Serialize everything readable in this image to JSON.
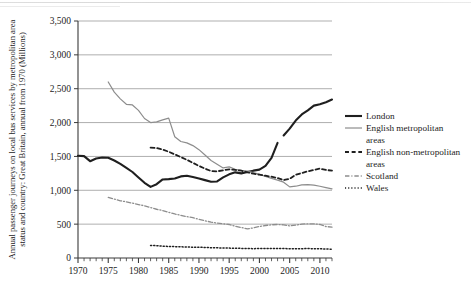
{
  "chart_data": {
    "type": "line",
    "title": "",
    "xlabel": "",
    "ylabel": "Annual passenger journeys on local bus services by metropolitan area status and country: Great Britain, annual from 1970 (Millions)",
    "ylabel_line1": "Annual passenger journeys on local bus services by metropolitan area",
    "ylabel_line2": "status and country: Great Britain, annual from 1970 (Millions)",
    "xlim": [
      1970,
      2012
    ],
    "ylim": [
      0,
      3500
    ],
    "y_ticks": [
      0,
      500,
      1000,
      1500,
      2000,
      2500,
      3000,
      3500
    ],
    "y_tick_labels": [
      "0",
      "500",
      "1,000",
      "1,500",
      "2,000",
      "2,500",
      "3,000",
      "3,500"
    ],
    "x_ticks": [
      1970,
      1975,
      1980,
      1985,
      1990,
      1995,
      2000,
      2005,
      2010
    ],
    "x_tick_labels": [
      "1970",
      "1975",
      "1980",
      "1985",
      "1990",
      "1995",
      "2000",
      "2005",
      "2010"
    ],
    "x_minor_step": 1,
    "grid": "horizontal",
    "legend_position": "right",
    "series": [
      {
        "name": "London",
        "style": "solid",
        "color": "#1f1f1f",
        "width": 2.1,
        "segments": [
          {
            "x": [
              1970,
              1971,
              1972,
              1973,
              1974,
              1975,
              1976,
              1977,
              1978,
              1979,
              1980,
              1981,
              1982,
              1983,
              1984,
              1985,
              1986,
              1987,
              1988,
              1989,
              1990,
              1991,
              1992,
              1993,
              1994,
              1995,
              1996,
              1997,
              1998,
              1999,
              2000,
              2001,
              2002,
              2003
            ],
            "y": [
              1510,
              1505,
              1430,
              1470,
              1485,
              1480,
              1440,
              1390,
              1330,
              1270,
              1190,
              1110,
              1050,
              1090,
              1160,
              1165,
              1175,
              1205,
              1215,
              1195,
              1175,
              1150,
              1125,
              1130,
              1190,
              1235,
              1265,
              1250,
              1270,
              1290,
              1305,
              1360,
              1480,
              1700
            ]
          },
          {
            "x": [
              2004,
              2005,
              2006,
              2007,
              2008,
              2009,
              2010,
              2011,
              2012
            ],
            "y": [
              1810,
              1910,
              2030,
              2120,
              2180,
              2250,
              2270,
              2300,
              2340
            ]
          }
        ]
      },
      {
        "name": "English metropolitan areas",
        "style": "solid",
        "color": "#8d8d8d",
        "width": 1.2,
        "segments": [
          {
            "x": [
              1975,
              1976,
              1977,
              1978,
              1979,
              1980,
              1981,
              1982,
              1983,
              1984,
              1985,
              1986,
              1987,
              1988,
              1989,
              1990,
              1991,
              1992,
              1993,
              1994,
              1995,
              1996,
              1997,
              1998,
              1999,
              2000,
              2001,
              2002,
              2003,
              2004,
              2005,
              2006,
              2007,
              2008,
              2009,
              2010,
              2011,
              2012
            ],
            "y": [
              2600,
              2450,
              2350,
              2270,
              2260,
              2180,
              2060,
              2000,
              2010,
              2040,
              2065,
              1790,
              1720,
              1700,
              1660,
              1600,
              1520,
              1440,
              1385,
              1330,
              1345,
              1310,
              1295,
              1285,
              1260,
              1235,
              1205,
              1175,
              1150,
              1120,
              1050,
              1060,
              1080,
              1085,
              1075,
              1060,
              1040,
              1020
            ]
          }
        ]
      },
      {
        "name": "English non-metropolitan areas",
        "style": "dashed",
        "color": "#1f1f1f",
        "width": 1.8,
        "segments": [
          {
            "x": [
              1982,
              1983,
              1984,
              1985,
              1986,
              1987,
              1988,
              1989,
              1990,
              1991,
              1992,
              1993,
              1994,
              1995,
              1996,
              1997,
              1998,
              1999,
              2000,
              2001,
              2002,
              2003,
              2004,
              2005,
              2006,
              2007,
              2008,
              2009,
              2010,
              2011,
              2012
            ],
            "y": [
              1630,
              1625,
              1600,
              1570,
              1530,
              1490,
              1450,
              1405,
              1360,
              1320,
              1285,
              1280,
              1295,
              1310,
              1300,
              1290,
              1265,
              1245,
              1230,
              1215,
              1200,
              1180,
              1150,
              1170,
              1230,
              1255,
              1280,
              1300,
              1320,
              1300,
              1290
            ]
          }
        ]
      },
      {
        "name": "Scotland",
        "style": "dashdot",
        "color": "#8d8d8d",
        "width": 1.3,
        "segments": [
          {
            "x": [
              1975,
              1976,
              1977,
              1978,
              1979,
              1980,
              1981,
              1982,
              1983,
              1984,
              1985,
              1986,
              1987,
              1988,
              1989,
              1990,
              1991,
              1992,
              1993,
              1994,
              1995,
              1996,
              1997,
              1998,
              1999,
              2000,
              2001,
              2002,
              2003,
              2004,
              2005,
              2006,
              2007,
              2008,
              2009,
              2010,
              2011,
              2012
            ],
            "y": [
              895,
              870,
              845,
              830,
              810,
              790,
              770,
              745,
              720,
              700,
              675,
              650,
              630,
              610,
              595,
              570,
              550,
              530,
              515,
              505,
              495,
              470,
              450,
              430,
              445,
              465,
              480,
              490,
              495,
              490,
              475,
              485,
              500,
              505,
              505,
              495,
              465,
              455
            ]
          }
        ]
      },
      {
        "name": "Wales",
        "style": "dotted",
        "color": "#1f1f1f",
        "width": 1.5,
        "segments": [
          {
            "x": [
              1982,
              1983,
              1984,
              1985,
              1986,
              1987,
              1988,
              1989,
              1990,
              1991,
              1992,
              1993,
              1994,
              1995,
              1996,
              1997,
              1998,
              1999,
              2000,
              2001,
              2002,
              2003,
              2004,
              2005,
              2006,
              2007,
              2008,
              2009,
              2010,
              2011,
              2012
            ],
            "y": [
              185,
              182,
              175,
              170,
              168,
              165,
              162,
              160,
              158,
              156,
              152,
              150,
              148,
              146,
              144,
              142,
              140,
              138,
              140,
              141,
              142,
              140,
              139,
              138,
              137,
              138,
              139,
              138,
              136,
              133,
              130
            ]
          }
        ]
      }
    ],
    "legend": [
      {
        "label": "London",
        "style": "solid",
        "color": "#1f1f1f",
        "width": 2.1
      },
      {
        "label": "English metropolitan",
        "label2": "areas",
        "style": "solid",
        "color": "#8d8d8d",
        "width": 1.2
      },
      {
        "label": "English non-metropolitan",
        "label2": "areas",
        "style": "dashed",
        "color": "#1f1f1f",
        "width": 1.8
      },
      {
        "label": "Scotland",
        "style": "dashdot",
        "color": "#8d8d8d",
        "width": 1.3
      },
      {
        "label": "Wales",
        "style": "dotted",
        "color": "#1f1f1f",
        "width": 1.5
      }
    ]
  }
}
